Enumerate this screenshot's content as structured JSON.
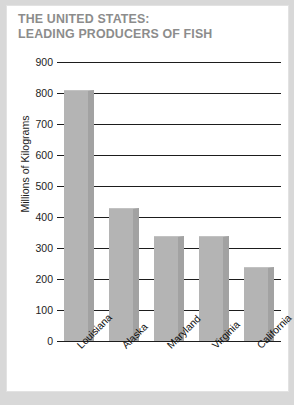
{
  "card": {
    "title_line1": "THE UNITED STATES:",
    "title_line2": "LEADING PRODUCERS OF FISH",
    "title_color": "#8c8c8c",
    "background": "#ffffff",
    "page_background": "#d8d8d8"
  },
  "chart_data": {
    "type": "bar",
    "title": "THE UNITED STATES: LEADING PRODUCERS OF FISH",
    "categories": [
      "Louisiana",
      "Alaska",
      "Maryland",
      "Virginia",
      "California"
    ],
    "values": [
      810,
      430,
      340,
      340,
      240
    ],
    "xlabel": "",
    "ylabel": "Millions of Kilograms",
    "ylim": [
      0,
      900
    ],
    "ytick_values": [
      0,
      100,
      200,
      300,
      400,
      500,
      600,
      700,
      800,
      900
    ],
    "ytick_labels": [
      "0",
      "100",
      "200",
      "300",
      "400",
      "500",
      "600",
      "700",
      "800",
      "900"
    ],
    "grid": true,
    "grid_color": "#1d1d1d",
    "legend": null,
    "bar_color": "#b4b4b4",
    "bar_shadow_color": "#a2a2a2",
    "xtick_rotation": -45
  }
}
